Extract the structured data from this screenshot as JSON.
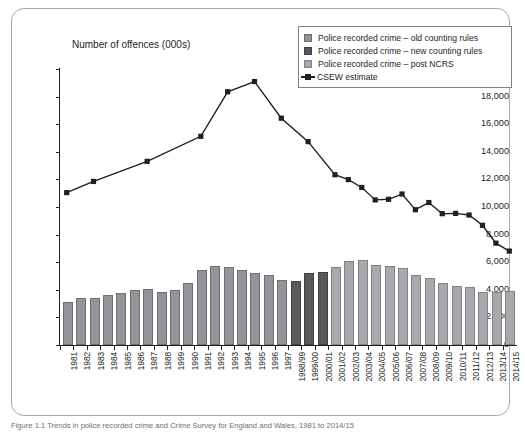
{
  "axis_title": "Number of offences (000s)",
  "caption": "Figure 1.1  Trends in police recorded crime and Crime Survey for England and Wales, 1981 to 2014/15",
  "legend": {
    "items": [
      {
        "label": "Police recorded crime – old counting rules",
        "icon": "square-swatch-icon",
        "color": "#939598"
      },
      {
        "label": "Police recorded crime – new counting rules",
        "icon": "square-swatch-icon",
        "color": "#58595b"
      },
      {
        "label": "Police recorded crime – post NCRS",
        "icon": "square-swatch-icon",
        "color": "#a7a9ac"
      },
      {
        "label": "CSEW estimate",
        "icon": "line-marker-icon",
        "color": "#231f20"
      }
    ]
  },
  "chart_data": {
    "type": "bar",
    "title": "",
    "subtitle": "",
    "xlabel": "",
    "ylabel": "Number of offences (000s)",
    "ylim": [
      0,
      20000
    ],
    "ytick_labels": [
      "20,000",
      "18,000",
      "16,000",
      "14,000",
      "12,000",
      "10,000",
      "8,000",
      "6,000",
      "4,000",
      "2,000",
      "0"
    ],
    "ytick_values": [
      20000,
      18000,
      16000,
      14000,
      12000,
      10000,
      8000,
      6000,
      4000,
      2000,
      0
    ],
    "grid": false,
    "legend_position": "top-right",
    "categories": [
      "1981",
      "1982",
      "1983",
      "1984",
      "1985",
      "1986",
      "1987",
      "1988",
      "1999",
      "1990",
      "1991",
      "1992",
      "1993",
      "1994",
      "1995",
      "1996",
      "1997",
      "1998/99",
      "1999/00",
      "2000/01",
      "2001/02",
      "2002/03",
      "2003/04",
      "2004/05",
      "2005/06",
      "2006/07",
      "2007/08",
      "2008/09",
      "2009/10",
      "2010/11",
      "2011/12",
      "2012/13",
      "2013/14",
      "2014/15"
    ],
    "series": [
      {
        "name": "Police recorded crime – old counting rules",
        "type": "bar",
        "color": "#939598",
        "values": [
          2964,
          3262,
          3247,
          3499,
          3612,
          3847,
          3892,
          3716,
          3870,
          4364,
          5276,
          5592,
          5527,
          5258,
          5100,
          4949,
          4598,
          null,
          null,
          null,
          null,
          null,
          null,
          null,
          null,
          null,
          null,
          null,
          null,
          null,
          null,
          null,
          null,
          null
        ]
      },
      {
        "name": "Police recorded crime – new counting rules",
        "type": "bar",
        "color": "#58595b",
        "values": [
          null,
          null,
          null,
          null,
          null,
          null,
          null,
          null,
          null,
          null,
          null,
          null,
          null,
          null,
          null,
          null,
          null,
          4482,
          5109,
          5171,
          5527,
          null,
          null,
          null,
          null,
          null,
          null,
          null,
          null,
          null,
          null,
          null,
          null,
          null
        ]
      },
      {
        "name": "Police recorded crime – post NCRS",
        "type": "bar",
        "color": "#a7a9ac",
        "values": [
          null,
          null,
          null,
          null,
          null,
          null,
          null,
          null,
          null,
          null,
          null,
          null,
          null,
          null,
          null,
          null,
          null,
          null,
          null,
          null,
          5525,
          5975,
          6014,
          5637,
          5555,
          5427,
          4951,
          4703,
          4338,
          4150,
          4045,
          3731,
          3707,
          3792
        ]
      },
      {
        "name": "CSEW estimate",
        "type": "line",
        "color": "#231f20",
        "x": [
          "1981",
          "1983",
          "1987",
          "1991",
          "1993",
          "1995",
          "1997",
          "1999/00",
          "2001/02",
          "2002/03",
          "2003/04",
          "2004/05",
          "2005/06",
          "2006/07",
          "2007/08",
          "2008/09",
          "2009/10",
          "2010/11",
          "2011/12",
          "2012/13",
          "2013/14",
          "2014/15"
        ],
        "values": [
          11044,
          11852,
          13310,
          15124,
          18350,
          19094,
          16437,
          14736,
          12339,
          11985,
          11417,
          10514,
          10558,
          10943,
          9803,
          10325,
          9517,
          9537,
          9418,
          8674,
          7379,
          6805
        ]
      }
    ]
  }
}
